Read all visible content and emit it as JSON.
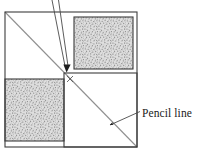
{
  "figure": {
    "background_color": "#ffffff",
    "stroke_color": "#3a3a3a",
    "pencil_line_color": "#8a8a8a",
    "leader_line_color": "#555555",
    "texture_color": "#9a9a9a",
    "texture_background": "#dcdcdc"
  },
  "annotations": {
    "pencil_line_label": "Pencil line",
    "pencil_line_label_x": 142,
    "pencil_line_label_y": 117,
    "center_mark_label": "x"
  },
  "geometry": {
    "outer_square": {
      "x": 5,
      "y": 12,
      "width": 132,
      "height": 135
    },
    "center_point": {
      "x": 64,
      "y": 73
    },
    "quadrants": [
      {
        "name": "top-left",
        "x": 5,
        "y": 12,
        "width": 59,
        "height": 61,
        "fill": "plain"
      },
      {
        "name": "top-right",
        "x": 74,
        "y": 17,
        "width": 59,
        "height": 52,
        "fill": "stipple"
      },
      {
        "name": "bottom-left",
        "x": 5,
        "y": 79,
        "width": 59,
        "height": 62,
        "fill": "stipple"
      },
      {
        "name": "bottom-right",
        "x": 64,
        "y": 73,
        "width": 73,
        "height": 74,
        "fill": "plain"
      }
    ],
    "pencil_diagonal": {
      "x1": 5,
      "y1": 12,
      "x2": 137,
      "y2": 147
    },
    "leader_to_center": {
      "x1": 53,
      "y1": 0,
      "x2": 66,
      "y2": 70
    },
    "leader_from_center_up": {
      "x1": 57,
      "y1": 0,
      "x2": 67,
      "y2": 69
    },
    "leader_to_pencil": {
      "x1": 139,
      "y1": 112,
      "x2": 108,
      "y2": 126
    }
  }
}
